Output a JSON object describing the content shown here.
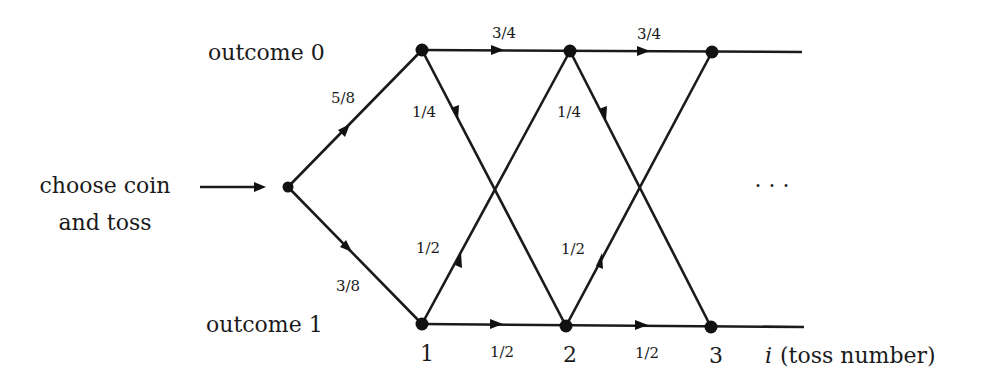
{
  "diagram": {
    "type": "state-transition / trellis",
    "input_label_line1": "choose coin",
    "input_label_line2": "and toss",
    "states": {
      "top": "outcome 0",
      "bottom": "outcome 1"
    },
    "initial_probs": {
      "to_outcome0": "5/8",
      "to_outcome1": "3/8"
    },
    "transitions": {
      "stay0": "3/4",
      "zero_to_one": "1/4",
      "one_to_zero": "1/2",
      "stay1": "1/2"
    },
    "toss_numbers": [
      "1",
      "2",
      "3"
    ],
    "axis_label_var": "i",
    "axis_label_text": "(toss number)",
    "ellipsis": "· · ·"
  }
}
